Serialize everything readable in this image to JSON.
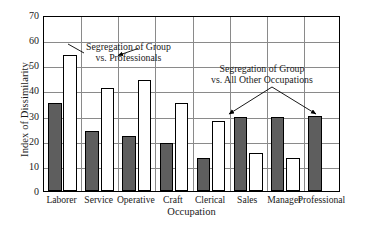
{
  "chart_data": {
    "type": "bar",
    "title": "",
    "xlabel": "Occupation",
    "ylabel": "Index of Dissimilarity",
    "ylim": [
      0,
      70
    ],
    "ytick_step": 10,
    "yticks": [
      70,
      60,
      50,
      40,
      30,
      20,
      10,
      0
    ],
    "grid": true,
    "legend_position": "none",
    "categories": [
      "Laborer",
      "Service",
      "Operative",
      "Craft",
      "Clerical",
      "Sales",
      "Manager",
      "Professional"
    ],
    "series": [
      {
        "name": "Segregation of Group vs. All Other Occupations",
        "color": "#5e5e5e",
        "style": "filled-dark",
        "values": [
          35,
          24,
          22,
          19,
          13,
          29.5,
          29.5,
          30
        ]
      },
      {
        "name": "Segregation of Group vs. Professionals",
        "color": "#ffffff",
        "style": "open-white",
        "values": [
          54,
          41,
          44,
          35,
          28,
          15,
          13,
          null
        ]
      }
    ],
    "annotations": [
      {
        "id": "annot-a",
        "lines": [
          "Segregation of Group",
          "vs. Professionals"
        ],
        "points_to": "white-bar-laborer"
      },
      {
        "id": "annot-b",
        "lines": [
          "Segregation of Group",
          "vs. All Other Occupations"
        ],
        "points_to": [
          "dark-bar-sales",
          "dark-bar-professional"
        ]
      }
    ]
  },
  "axis": {
    "y_title": "Index of Dissimilarity",
    "x_title": "Occupation"
  },
  "footer": {
    "artifact_text": ""
  }
}
